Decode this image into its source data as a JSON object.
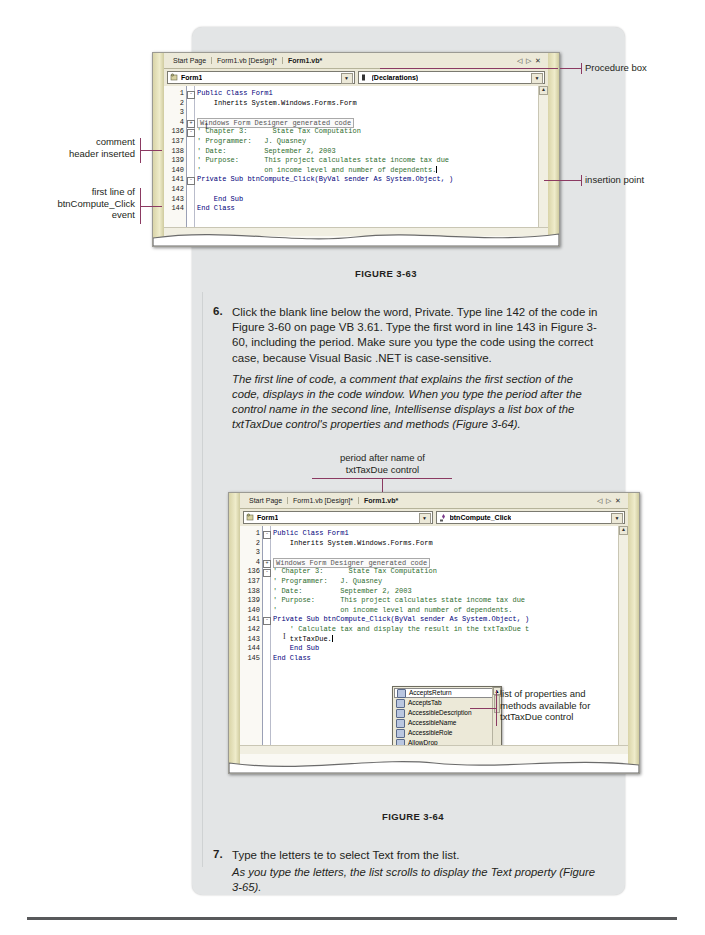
{
  "figure1": {
    "tabs": [
      {
        "label": "Start Page",
        "active": false
      },
      {
        "label": "Form1.vb [Design]*",
        "active": false
      },
      {
        "label": "Form1.vb*",
        "active": true
      }
    ],
    "nav": {
      "prev": "◁",
      "next": "▷",
      "close": "✕"
    },
    "class_combo": {
      "value": "Form1",
      "arrow": "▼"
    },
    "method_combo": {
      "value": "(Declarations)",
      "arrow": "▼"
    },
    "code_lines": [
      {
        "num": "1",
        "text": "Public Class Form1",
        "style": "kw",
        "outline": "-"
      },
      {
        "num": "2",
        "text": "    Inherits System.Windows.Forms.Form",
        "style": "plain"
      },
      {
        "num": "3",
        "text": "",
        "style": "plain"
      },
      {
        "num": "4",
        "text": "Windows Form Designer generated code",
        "style": "region",
        "outline": "+"
      },
      {
        "num": "136",
        "text": "' Chapter 3:      State Tax Computation",
        "style": "cmt",
        "outline": "-"
      },
      {
        "num": "137",
        "text": "' Programmer:   J. Quasney",
        "style": "cmt"
      },
      {
        "num": "138",
        "text": "' Date:         September 2, 2003",
        "style": "cmt"
      },
      {
        "num": "139",
        "text": "' Purpose:      This project calculates state income tax due",
        "style": "cmt"
      },
      {
        "num": "140",
        "text": "'               on income level and number of dependents.",
        "style": "cmt",
        "caret": true
      },
      {
        "num": "141",
        "text": "Private Sub btnCompute_Click(ByVal sender As System.Object, )",
        "style": "kw",
        "outline": "-"
      },
      {
        "num": "142",
        "text": "",
        "style": "plain"
      },
      {
        "num": "143",
        "text": "    End Sub",
        "style": "kw"
      },
      {
        "num": "144",
        "text": "End Class",
        "style": "kw"
      }
    ],
    "caption": "FIGURE 3-63"
  },
  "figure1_callouts": {
    "procedure_box": "Procedure box",
    "insertion_point": "insertion point",
    "comment_header": "comment\nheader inserted",
    "first_line": "first line of\nbtnCompute_Click\nevent"
  },
  "step6": {
    "number": "6.",
    "text": "Click the blank line below the word, Private. Type line 142 of the code in Figure 3-60 on page VB 3.61. Type the first word in line 143 in Figure 3-60, including the period. Make sure you type the code using the correct case, because Visual Basic .NET is case-sensitive.",
    "note": "The first line of code, a comment that explains the first section of the code, displays in the code window. When you type the period after the control name in the second line, Intellisense displays a list box of the txtTaxDue control's properties and methods (Figure 3-64)."
  },
  "figure2": {
    "callout_top": "period after name of\ntxtTaxDue control",
    "tabs": [
      {
        "label": "Start Page",
        "active": false
      },
      {
        "label": "Form1.vb [Design]*",
        "active": false
      },
      {
        "label": "Form1.vb*",
        "active": true
      }
    ],
    "nav": {
      "prev": "◁",
      "next": "▷",
      "close": "✕"
    },
    "class_combo": {
      "value": "Form1",
      "arrow": "▼"
    },
    "method_combo": {
      "value": "btnCompute_Click",
      "arrow": "▼"
    },
    "code_lines": [
      {
        "num": "1",
        "text": "Public Class Form1",
        "style": "kw",
        "outline": "-"
      },
      {
        "num": "2",
        "text": "    Inherits System.Windows.Forms.Form",
        "style": "plain"
      },
      {
        "num": "3",
        "text": "",
        "style": "plain"
      },
      {
        "num": "4",
        "text": "Windows Form Designer generated code",
        "style": "region",
        "outline": "+"
      },
      {
        "num": "136",
        "text": "' Chapter 3:      State Tax Computation",
        "style": "cmt",
        "outline": "-"
      },
      {
        "num": "137",
        "text": "' Programmer:   J. Quasney",
        "style": "cmt"
      },
      {
        "num": "138",
        "text": "' Date:         September 2, 2003",
        "style": "cmt"
      },
      {
        "num": "139",
        "text": "' Purpose:      This project calculates state income tax due",
        "style": "cmt"
      },
      {
        "num": "140",
        "text": "'               on income level and number of dependents.",
        "style": "cmt"
      },
      {
        "num": "141",
        "text": "Private Sub btnCompute_Click(ByVal sender As System.Object, )",
        "style": "kw",
        "outline": "-"
      },
      {
        "num": "142",
        "text": "    ' Calculate tax and display the result in the txtTaxDue t",
        "style": "cmt"
      },
      {
        "num": "143",
        "text": "    txtTaxDue.",
        "style": "plain",
        "caret": true
      },
      {
        "num": "144",
        "text": "    End Sub",
        "style": "kw"
      },
      {
        "num": "145",
        "text": "End Class",
        "style": "kw"
      }
    ],
    "intellisense": {
      "items": [
        {
          "label": "AcceptsReturn",
          "kind": "property",
          "selected": true
        },
        {
          "label": "AcceptsTab",
          "kind": "property",
          "selected": false
        },
        {
          "label": "AccessibleDescription",
          "kind": "property",
          "selected": false
        },
        {
          "label": "AccessibleName",
          "kind": "property",
          "selected": false
        },
        {
          "label": "AccessibleRole",
          "kind": "property",
          "selected": false
        },
        {
          "label": "AllowDrop",
          "kind": "property",
          "selected": false
        },
        {
          "label": "Anchor",
          "kind": "property",
          "selected": false
        },
        {
          "label": "AppendText",
          "kind": "method",
          "selected": false
        },
        {
          "label": "AutoSize",
          "kind": "property",
          "selected": false
        },
        {
          "label": "BackColor",
          "kind": "property",
          "selected": false
        }
      ],
      "scroll_up": "▲",
      "scroll_down": "▼"
    },
    "callout_right": "list of properties and\nmethods available for\ntxtTaxDue control",
    "caption": "FIGURE 3-64"
  },
  "step7": {
    "number": "7.",
    "text": "Type the letters te to select Text from the list.",
    "note": "As you type the letters, the list scrolls to display the Text property (Figure 3-65)."
  },
  "colors": {
    "accent": "#8b3a62",
    "comment": "#2e6d2e",
    "keyword": "#00007a",
    "panel": "#e3e5e6"
  }
}
